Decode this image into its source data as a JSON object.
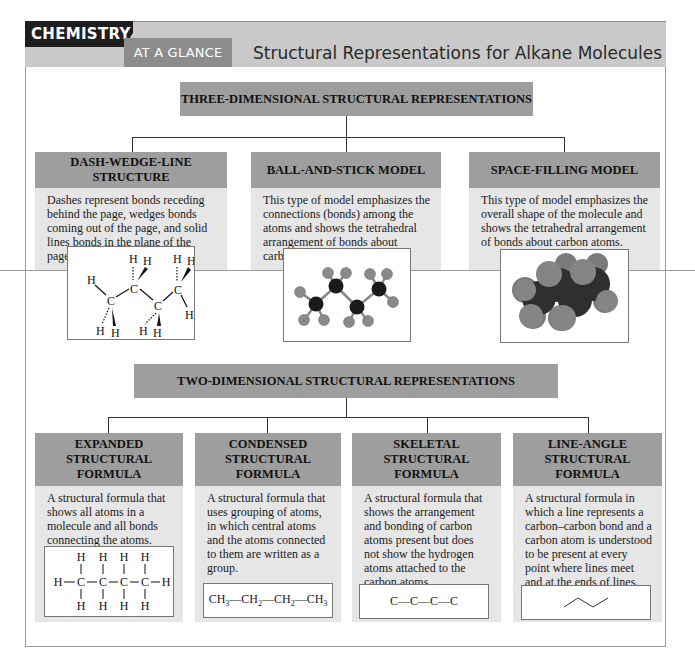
{
  "header": {
    "badge_top": "CHEMISTRY",
    "badge_bottom": "AT A GLANCE",
    "title": "Structural Representations for Alkane Molecules"
  },
  "three_d": {
    "section_title": "THREE-DIMENSIONAL STRUCTURAL REPRESENTATIONS",
    "cards": [
      {
        "title": "DASH-WEDGE-LINE STRUCTURE",
        "description": "Dashes represent bonds receding behind the page, wedges bonds coming out of the page, and solid lines bonds in the plane of the page.",
        "figure": "dash-wedge-line-butane"
      },
      {
        "title": "BALL-AND-STICK MODEL",
        "description": "This type of model emphasizes the connections (bonds) among the atoms and shows the tetrahedral arrangement of bonds about carbon atoms.",
        "figure": "ball-and-stick-butane"
      },
      {
        "title": "SPACE-FILLING MODEL",
        "description": "This type of model emphasizes the overall shape of the molecule and shows the tetrahedral arrangement of bonds about carbon atoms.",
        "figure": "space-filling-butane"
      }
    ]
  },
  "two_d": {
    "section_title": "TWO-DIMENSIONAL STRUCTURAL REPRESENTATIONS",
    "cards": [
      {
        "title": "EXPANDED STRUCTURAL FORMULA",
        "description": "A structural formula that shows all atoms in a molecule and all bonds connecting the atoms.",
        "figure": "expanded-formula-butane"
      },
      {
        "title": "CONDENSED STRUCTURAL FORMULA",
        "description": "A structural formula that uses grouping of atoms, in which central atoms and the atoms connected to them are written as a group.",
        "formula_parts": [
          "CH",
          "3",
          "—CH",
          "2",
          "—CH",
          "2",
          "—CH",
          "3"
        ]
      },
      {
        "title": "SKELETAL STRUCTURAL FORMULA",
        "description": "A structural formula that shows the arrangement and bonding of carbon atoms present but does not show the hydrogen atoms attached to the carbon atoms.",
        "formula": "C—C—C—C"
      },
      {
        "title": "LINE-ANGLE STRUCTURAL FORMULA",
        "description": "A structural formula in which a line represents a carbon–carbon bond and a carbon atom is understood to be present at every point where lines meet and at the ends of lines.",
        "figure": "zigzag-line"
      }
    ]
  },
  "atoms": {
    "carbon": "C",
    "hydrogen": "H"
  },
  "colors": {
    "badge_dark": "#1e1e1e",
    "badge_mid": "#8c8c8c",
    "header_band": "#c9c9c9",
    "section_bar": "#9e9e9e",
    "card_body": "#e6e6e6"
  }
}
